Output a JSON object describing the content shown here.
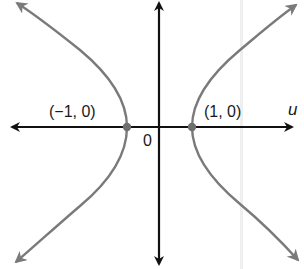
{
  "diagram": {
    "type": "hyperbola",
    "axes": {
      "horizontal_label": "u",
      "origin_label": "0"
    },
    "points": [
      {
        "label": "(−1, 0)",
        "x": -1,
        "y": 0
      },
      {
        "label": "(1, 0)",
        "x": 1,
        "y": 0
      }
    ],
    "colors": {
      "axis": "#111111",
      "curve": "#7a7a7a",
      "vertex": "#6e6e6e"
    }
  }
}
